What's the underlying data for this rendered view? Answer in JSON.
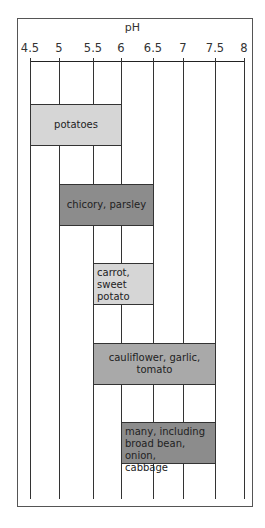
{
  "chart_data": {
    "type": "bar",
    "orientation": "horizontal-range",
    "title": "",
    "xlabel": "pH",
    "ylabel": "",
    "xlim": [
      4.5,
      8
    ],
    "x_ticks": [
      "4.5",
      "5",
      "5.5",
      "6",
      "6.5",
      "7",
      "7.5",
      "8"
    ],
    "grid": true,
    "legend": null,
    "categories": [
      "potatoes",
      "chicory, parsley",
      "carrot, sweet potato",
      "cauliflower, garlic, tomato",
      "many, including broad bean, onion, cabbage"
    ],
    "ranges": [
      {
        "label": "potatoes",
        "lines": [
          "potatoes"
        ],
        "min": 4.5,
        "max": 6,
        "shade": "light",
        "align": "center"
      },
      {
        "label": "chicory, parsley",
        "lines": [
          "chicory, parsley"
        ],
        "min": 5,
        "max": 6.5,
        "shade": "dark",
        "align": "center"
      },
      {
        "label": "carrot, sweet potato",
        "lines": [
          "carrot,",
          "sweet potato"
        ],
        "min": 5.5,
        "max": 6.5,
        "shade": "light",
        "align": "left"
      },
      {
        "label": "cauliflower, garlic, tomato",
        "lines": [
          "cauliflower, garlic, tomato"
        ],
        "min": 5.5,
        "max": 7.5,
        "shade": "mid",
        "align": "center"
      },
      {
        "label": "many, including broad bean, onion, cabbage",
        "lines": [
          "many, including",
          "broad bean, onion,",
          "cabbage"
        ],
        "min": 6,
        "max": 7.5,
        "shade": "dark",
        "align": "left"
      }
    ],
    "colors": {
      "light": "#d6d6d6",
      "mid": "#a9a9a9",
      "dark": "#8c8c8c",
      "lines": "#333333"
    }
  }
}
